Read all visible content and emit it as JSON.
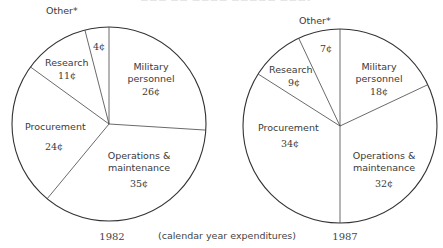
{
  "chart_data": [
    {
      "type": "pie",
      "title": "1982",
      "unit": "¢ per dollar",
      "start_angle_deg": 0,
      "direction": "clockwise",
      "categories": [
        "Military personnel",
        "Operations & maintenance",
        "Procurement",
        "Research",
        "Other*"
      ],
      "values": [
        26,
        35,
        24,
        11,
        4
      ],
      "value_labels": [
        "26¢",
        "35¢",
        "24¢",
        "11¢",
        "4¢"
      ]
    },
    {
      "type": "pie",
      "title": "1987",
      "unit": "¢ per dollar",
      "start_angle_deg": 0,
      "direction": "clockwise",
      "categories": [
        "Military personnel",
        "Operations & maintenance",
        "Procurement",
        "Research",
        "Other*"
      ],
      "values": [
        18,
        32,
        34,
        9,
        7
      ],
      "value_labels": [
        "18¢",
        "32¢",
        "34¢",
        "9¢",
        "7¢"
      ]
    }
  ],
  "caption": "(calendar year expenditures)",
  "pies": [
    {
      "year": "1982",
      "labels": {
        "military_1": "Military",
        "military_2": "personnel",
        "military_v": "26¢",
        "om_1": "Operations &",
        "om_2": "maintenance",
        "om_v": "35¢",
        "proc_1": "Procurement",
        "proc_v": "24¢",
        "research_1": "Research",
        "research_v": "11¢",
        "other_1": "Other*",
        "other_v": "4¢"
      }
    },
    {
      "year": "1987",
      "labels": {
        "military_1": "Military",
        "military_2": "personnel",
        "military_v": "18¢",
        "om_1": "Operations &",
        "om_2": "maintenance",
        "om_v": "32¢",
        "proc_1": "Procurement",
        "proc_v": "34¢",
        "research_1": "Research",
        "research_v": "9¢",
        "other_1": "Other*",
        "other_v": "7¢"
      }
    }
  ]
}
